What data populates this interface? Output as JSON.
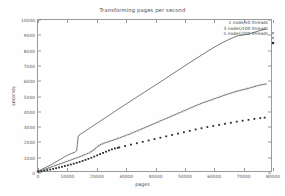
{
  "chart_data": {
    "type": "line",
    "title": "Transforming pages per second",
    "xlabel": "pages",
    "ylabel": "seconds",
    "xlim": [
      0,
      80000
    ],
    "ylim": [
      0,
      10000
    ],
    "xticks": [
      0,
      10000,
      20000,
      30000,
      40000,
      50000,
      60000,
      70000,
      80000
    ],
    "yticks": [
      0,
      1000,
      2000,
      3000,
      4000,
      5000,
      6000,
      7000,
      8000,
      9000,
      10000
    ],
    "grid": false,
    "legend_position": "top-right",
    "series": [
      {
        "name": "1 node/50 threads",
        "marker": "plus",
        "style": "solid-dense-points",
        "color": "#3a3a3a",
        "x": [
          0,
          1000,
          2000,
          3000,
          4000,
          5000,
          6000,
          7000,
          8000,
          9000,
          10000,
          11000,
          12000,
          13000,
          13500,
          13800,
          14000,
          14300,
          15000,
          16000,
          18000,
          20000,
          24000,
          28000,
          32000,
          36000,
          40000,
          44000,
          48000,
          52000,
          56000,
          60000,
          62000,
          64000,
          68000,
          72000,
          76000,
          78000
        ],
        "y": [
          20,
          110,
          210,
          300,
          400,
          500,
          610,
          720,
          830,
          950,
          1060,
          1150,
          1230,
          1300,
          1400,
          1900,
          2300,
          2400,
          2500,
          2620,
          2880,
          3130,
          3640,
          4150,
          4650,
          5150,
          5640,
          6140,
          6650,
          7150,
          7640,
          8120,
          8330,
          8540,
          8890,
          9010,
          9250,
          9350
        ]
      },
      {
        "name": "3 nodes/100 threads",
        "marker": "cross",
        "style": "dotted",
        "color": "#4a4a4a",
        "x": [
          0,
          2000,
          4000,
          6000,
          8000,
          10000,
          12000,
          14000,
          16000,
          18000,
          19000,
          20000,
          21000,
          22000,
          24000,
          26000,
          28000,
          32000,
          36000,
          40000,
          44000,
          48000,
          52000,
          56000,
          60000,
          64000,
          68000,
          72000,
          76000,
          78000
        ],
        "y": [
          15,
          135,
          270,
          410,
          540,
          680,
          820,
          960,
          1110,
          1270,
          1400,
          1560,
          1720,
          1830,
          1960,
          2090,
          2220,
          2520,
          2840,
          3170,
          3500,
          3830,
          4160,
          4490,
          4760,
          5030,
          5280,
          5470,
          5690,
          5750
        ]
      },
      {
        "name": "5 nodes/200 threads",
        "marker": "star",
        "style": "points",
        "color": "#2b2b2b",
        "x": [
          500,
          1500,
          2500,
          3500,
          4500,
          5500,
          6500,
          7500,
          8500,
          9500,
          10500,
          11500,
          12500,
          13500,
          14500,
          15500,
          16500,
          17500,
          18500,
          19500,
          20500,
          21500,
          22500,
          23500,
          24500,
          25500,
          26500,
          27500,
          28000,
          30000,
          32000,
          34000,
          36000,
          38000,
          40000,
          42000,
          44000,
          46000,
          48000,
          50000,
          52000,
          54000,
          56000,
          58000,
          60000,
          62000,
          64000,
          66000,
          68000,
          70000,
          72000,
          74000,
          76000,
          77500
        ],
        "y": [
          10,
          45,
          85,
          125,
          165,
          205,
          250,
          295,
          340,
          390,
          440,
          490,
          545,
          600,
          660,
          720,
          790,
          860,
          930,
          1010,
          1090,
          1170,
          1250,
          1330,
          1410,
          1480,
          1540,
          1580,
          1610,
          1700,
          1790,
          1880,
          1970,
          2060,
          2150,
          2240,
          2330,
          2420,
          2510,
          2600,
          2690,
          2780,
          2860,
          2940,
          3010,
          3080,
          3150,
          3220,
          3290,
          3350,
          3410,
          3470,
          3520,
          3550
        ]
      }
    ]
  }
}
